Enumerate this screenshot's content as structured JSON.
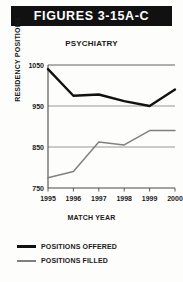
{
  "banner": {
    "title": "FIGURES 3-15A-C"
  },
  "legend": {
    "offered_label": "POSITIONS OFFERED",
    "filled_label": "POSITIONS FILLED",
    "offered_color": "#111111",
    "filled_color": "#808080"
  },
  "chart_data": {
    "type": "line",
    "title": "PSYCHIATRY",
    "xlabel": "MATCH YEAR",
    "ylabel": "RESIDENCY POSITIONS",
    "categories": [
      "1995",
      "1996",
      "1997",
      "1998",
      "1999",
      "2000"
    ],
    "x": [
      1995,
      1996,
      1997,
      1998,
      1999,
      2000
    ],
    "series": [
      {
        "name": "POSITIONS OFFERED",
        "color": "#111111",
        "values": [
          1040,
          975,
          978,
          962,
          950,
          990
        ]
      },
      {
        "name": "POSITIONS FILLED",
        "color": "#808080",
        "values": [
          775,
          790,
          862,
          855,
          890,
          890
        ]
      }
    ],
    "ylim": [
      750,
      1050
    ],
    "yticks": [
      750,
      850,
      950,
      1050
    ],
    "ytick_labels": [
      "750",
      "850",
      "950",
      "1050"
    ],
    "xlim": [
      1995,
      2000
    ],
    "grid": true,
    "legend_position": "below"
  }
}
